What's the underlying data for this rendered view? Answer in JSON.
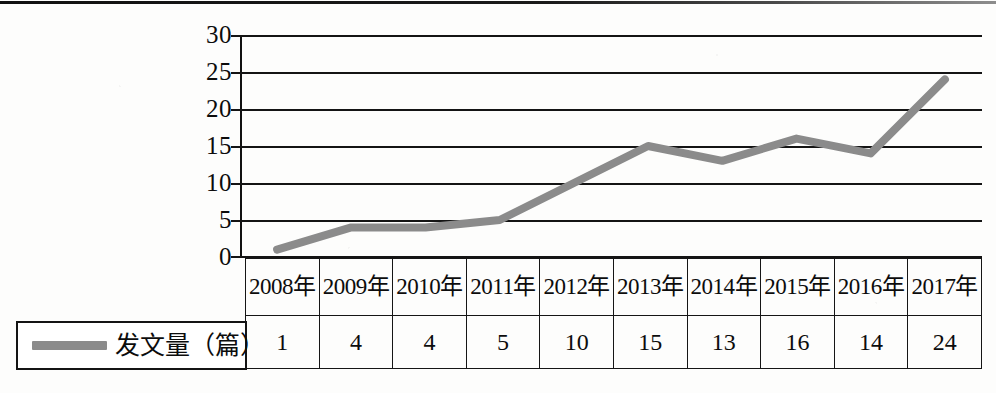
{
  "figure": {
    "legend_label": "发文量（篇）",
    "line_color": "#8b8b8b",
    "axis_color": "#141414"
  },
  "chart_data": {
    "type": "line",
    "title": "",
    "xlabel": "",
    "ylabel": "",
    "ylim": [
      0,
      30
    ],
    "yticks": [
      30,
      25,
      20,
      15,
      10,
      5,
      0
    ],
    "grid": true,
    "legend_position": "bottom-left",
    "categories": [
      "2008年",
      "2009年",
      "2010年",
      "2011年",
      "2012年",
      "2013年",
      "2014年",
      "2015年",
      "2016年",
      "2017年"
    ],
    "series": [
      {
        "name": "发文量（篇）",
        "values": [
          1,
          4,
          4,
          5,
          10,
          15,
          13,
          16,
          14,
          24
        ]
      }
    ]
  },
  "table": {
    "years": [
      "2008年",
      "2009年",
      "2010年",
      "2011年",
      "2012年",
      "2013年",
      "2014年",
      "2015年",
      "2016年",
      "2017年"
    ],
    "values": [
      "1",
      "4",
      "4",
      "5",
      "10",
      "15",
      "13",
      "16",
      "14",
      "24"
    ]
  },
  "yaxis": {
    "labels": [
      "30",
      "25",
      "20",
      "15",
      "10",
      "5",
      "0"
    ]
  }
}
